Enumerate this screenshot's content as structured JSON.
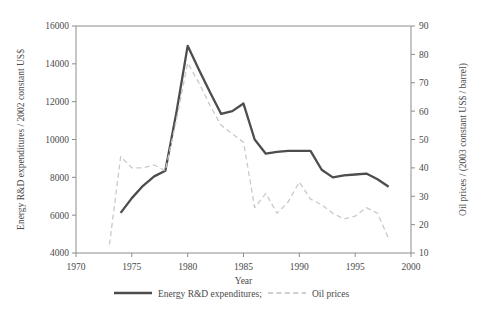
{
  "chart_data": {
    "type": "line",
    "title": "",
    "xlabel": "Year",
    "ylabel": "Energy R&D expenditures / 2002 constant US$",
    "y2label": "Oil prices / (2003 constant US$ / barrel)",
    "xlim": [
      1970,
      2000
    ],
    "ylim": [
      4000,
      16000
    ],
    "y2lim": [
      10,
      90
    ],
    "xticks": [
      1970,
      1975,
      1980,
      1985,
      1990,
      1995,
      2000
    ],
    "xticklabels": [
      "1970",
      "1975",
      "1980",
      "1985",
      "1990",
      "1995",
      "2000"
    ],
    "yticks": [
      4000,
      6000,
      8000,
      10000,
      12000,
      14000,
      16000
    ],
    "yticklabels": [
      "4000",
      "6000",
      "8000",
      "10000",
      "12000",
      "14000",
      "16000"
    ],
    "y2ticks": [
      10,
      20,
      30,
      40,
      50,
      60,
      70,
      80,
      90
    ],
    "y2ticklabels": [
      "10",
      "20",
      "30",
      "40",
      "50",
      "60",
      "70",
      "80",
      "90"
    ],
    "grid": false,
    "legend_position": "below",
    "series": [
      {
        "name": "Energy R&D expenditures;",
        "axis": "left",
        "style": "solid",
        "color": "#4d4d4d",
        "x": [
          1974,
          1975,
          1976,
          1977,
          1978,
          1979,
          1980,
          1981,
          1982,
          1983,
          1984,
          1985,
          1986,
          1987,
          1988,
          1989,
          1990,
          1991,
          1992,
          1993,
          1994,
          1995,
          1996,
          1997,
          1998
        ],
        "values": [
          6120,
          6900,
          7550,
          8050,
          8350,
          11450,
          14950,
          13700,
          12500,
          11350,
          11500,
          11900,
          10000,
          9250,
          9350,
          9400,
          9400,
          9400,
          8400,
          8000,
          8100,
          8150,
          8200,
          7900,
          7500
        ]
      },
      {
        "name": "Oil prices",
        "axis": "right",
        "style": "dashed",
        "color": "#c9c9c9",
        "x": [
          1973,
          1974,
          1975,
          1976,
          1977,
          1978,
          1979,
          1980,
          1981,
          1982,
          1983,
          1984,
          1985,
          1986,
          1987,
          1988,
          1989,
          1990,
          1991,
          1992,
          1993,
          1994,
          1995,
          1996,
          1997,
          1998
        ],
        "values": [
          13,
          44,
          40,
          40,
          41,
          39,
          57,
          77,
          70,
          62,
          55,
          52,
          49,
          26,
          31,
          24,
          28,
          35,
          29,
          27,
          24,
          22,
          23,
          26,
          24,
          15
        ]
      }
    ]
  },
  "legend": {
    "items": [
      {
        "label": "Energy R&D expenditures;",
        "style": "solid"
      },
      {
        "label": "Oil prices",
        "style": "dashed"
      }
    ]
  }
}
